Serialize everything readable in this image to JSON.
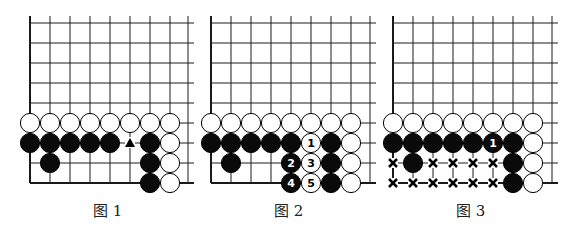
{
  "grid": {
    "spacing": 20,
    "top_y": 16,
    "first_row_y": 23,
    "rows": 9,
    "line_color": "#1a1a1a"
  },
  "diagrams": [
    {
      "caption": "图 1",
      "origin_x": 30,
      "right_border_x": 188,
      "stones": [
        {
          "c": 0,
          "r": 5,
          "color": "white"
        },
        {
          "c": 1,
          "r": 5,
          "color": "white"
        },
        {
          "c": 2,
          "r": 5,
          "color": "white"
        },
        {
          "c": 3,
          "r": 5,
          "color": "white"
        },
        {
          "c": 4,
          "r": 5,
          "color": "white"
        },
        {
          "c": 5,
          "r": 5,
          "color": "white"
        },
        {
          "c": 6,
          "r": 5,
          "color": "white"
        },
        {
          "c": 7,
          "r": 5,
          "color": "white"
        },
        {
          "c": 0,
          "r": 6,
          "color": "black"
        },
        {
          "c": 1,
          "r": 6,
          "color": "black"
        },
        {
          "c": 2,
          "r": 6,
          "color": "black"
        },
        {
          "c": 3,
          "r": 6,
          "color": "black"
        },
        {
          "c": 4,
          "r": 6,
          "color": "black"
        },
        {
          "c": 6,
          "r": 6,
          "color": "black"
        },
        {
          "c": 7,
          "r": 6,
          "color": "white"
        },
        {
          "c": 1,
          "r": 7,
          "color": "black"
        },
        {
          "c": 6,
          "r": 7,
          "color": "black"
        },
        {
          "c": 7,
          "r": 7,
          "color": "white"
        },
        {
          "c": 6,
          "r": 8,
          "color": "black"
        },
        {
          "c": 7,
          "r": 8,
          "color": "white"
        }
      ],
      "markers": [
        {
          "c": 5,
          "r": 6,
          "type": "triangle"
        }
      ]
    },
    {
      "caption": "图 2",
      "origin_x": 211,
      "right_border_x": 370,
      "stones": [
        {
          "c": 0,
          "r": 5,
          "color": "white"
        },
        {
          "c": 1,
          "r": 5,
          "color": "white"
        },
        {
          "c": 2,
          "r": 5,
          "color": "white"
        },
        {
          "c": 3,
          "r": 5,
          "color": "white"
        },
        {
          "c": 4,
          "r": 5,
          "color": "white"
        },
        {
          "c": 5,
          "r": 5,
          "color": "white"
        },
        {
          "c": 6,
          "r": 5,
          "color": "white"
        },
        {
          "c": 7,
          "r": 5,
          "color": "white"
        },
        {
          "c": 0,
          "r": 6,
          "color": "black"
        },
        {
          "c": 1,
          "r": 6,
          "color": "black"
        },
        {
          "c": 2,
          "r": 6,
          "color": "black"
        },
        {
          "c": 3,
          "r": 6,
          "color": "black"
        },
        {
          "c": 4,
          "r": 6,
          "color": "black"
        },
        {
          "c": 5,
          "r": 6,
          "color": "white",
          "label": "1"
        },
        {
          "c": 6,
          "r": 6,
          "color": "black"
        },
        {
          "c": 7,
          "r": 6,
          "color": "white"
        },
        {
          "c": 1,
          "r": 7,
          "color": "black"
        },
        {
          "c": 4,
          "r": 7,
          "color": "black",
          "label": "2"
        },
        {
          "c": 5,
          "r": 7,
          "color": "white",
          "label": "3"
        },
        {
          "c": 6,
          "r": 7,
          "color": "black"
        },
        {
          "c": 7,
          "r": 7,
          "color": "white"
        },
        {
          "c": 4,
          "r": 8,
          "color": "black",
          "label": "4"
        },
        {
          "c": 5,
          "r": 8,
          "color": "white",
          "label": "5"
        },
        {
          "c": 6,
          "r": 8,
          "color": "black"
        },
        {
          "c": 7,
          "r": 8,
          "color": "white"
        }
      ],
      "markers": []
    },
    {
      "caption": "图 3",
      "origin_x": 393,
      "right_border_x": 552,
      "stones": [
        {
          "c": 0,
          "r": 5,
          "color": "white"
        },
        {
          "c": 1,
          "r": 5,
          "color": "white"
        },
        {
          "c": 2,
          "r": 5,
          "color": "white"
        },
        {
          "c": 3,
          "r": 5,
          "color": "white"
        },
        {
          "c": 4,
          "r": 5,
          "color": "white"
        },
        {
          "c": 5,
          "r": 5,
          "color": "white"
        },
        {
          "c": 6,
          "r": 5,
          "color": "white"
        },
        {
          "c": 7,
          "r": 5,
          "color": "white"
        },
        {
          "c": 0,
          "r": 6,
          "color": "black"
        },
        {
          "c": 1,
          "r": 6,
          "color": "black"
        },
        {
          "c": 2,
          "r": 6,
          "color": "black"
        },
        {
          "c": 3,
          "r": 6,
          "color": "black"
        },
        {
          "c": 4,
          "r": 6,
          "color": "black"
        },
        {
          "c": 5,
          "r": 6,
          "color": "black",
          "label": "1"
        },
        {
          "c": 6,
          "r": 6,
          "color": "black"
        },
        {
          "c": 7,
          "r": 6,
          "color": "white"
        },
        {
          "c": 1,
          "r": 7,
          "color": "black"
        },
        {
          "c": 6,
          "r": 7,
          "color": "black"
        },
        {
          "c": 7,
          "r": 7,
          "color": "white"
        },
        {
          "c": 6,
          "r": 8,
          "color": "black"
        },
        {
          "c": 7,
          "r": 8,
          "color": "white"
        }
      ],
      "markers": [
        {
          "c": 0,
          "r": 7,
          "type": "x"
        },
        {
          "c": 2,
          "r": 7,
          "type": "x"
        },
        {
          "c": 3,
          "r": 7,
          "type": "x"
        },
        {
          "c": 4,
          "r": 7,
          "type": "x"
        },
        {
          "c": 5,
          "r": 7,
          "type": "x"
        },
        {
          "c": 0,
          "r": 8,
          "type": "x"
        },
        {
          "c": 1,
          "r": 8,
          "type": "x"
        },
        {
          "c": 2,
          "r": 8,
          "type": "x"
        },
        {
          "c": 3,
          "r": 8,
          "type": "x"
        },
        {
          "c": 4,
          "r": 8,
          "type": "x"
        },
        {
          "c": 5,
          "r": 8,
          "type": "x"
        }
      ]
    }
  ]
}
